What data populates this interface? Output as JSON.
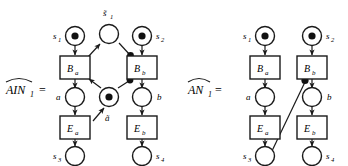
{
  "figure": {
    "background_color": "#ffffff",
    "stroke_color": "#1a1a1a",
    "token_color": "#111111",
    "nets": [
      {
        "id": "left-net",
        "label_main": "AIN",
        "label_sub": "1",
        "label_equals": "=",
        "label_full": "AIN̂₁ =",
        "places": [
          {
            "id": "s1",
            "label": "s",
            "sub": "1",
            "tokens": 1,
            "label_side": "left"
          },
          {
            "id": "s1t",
            "label": "s̃",
            "sub": "1",
            "tokens": 0,
            "label_side": "top"
          },
          {
            "id": "s2",
            "label": "s",
            "sub": "2",
            "tokens": 1,
            "label_side": "right"
          },
          {
            "id": "a",
            "label": "a",
            "sub": "",
            "tokens": 0,
            "label_side": "left"
          },
          {
            "id": "at",
            "label": "ã",
            "sub": "",
            "tokens": 1,
            "label_side": "bottom"
          },
          {
            "id": "b",
            "label": "b",
            "sub": "",
            "tokens": 0,
            "label_side": "right"
          },
          {
            "id": "s3",
            "label": "s",
            "sub": "3",
            "tokens": 0,
            "label_side": "left"
          },
          {
            "id": "s4",
            "label": "s",
            "sub": "4",
            "tokens": 0,
            "label_side": "right"
          }
        ],
        "transitions": [
          {
            "id": "Ba",
            "label": "B",
            "sub": "a"
          },
          {
            "id": "Bb",
            "label": "B",
            "sub": "b"
          },
          {
            "id": "Ea",
            "label": "E",
            "sub": "a"
          },
          {
            "id": "Eb",
            "label": "E",
            "sub": "b"
          }
        ],
        "arcs": [
          {
            "from": "s1",
            "to": "Ba",
            "kind": "arrow"
          },
          {
            "from": "s2",
            "to": "Bb",
            "kind": "arrow"
          },
          {
            "from": "Ba",
            "to": "a",
            "kind": "arrow"
          },
          {
            "from": "Bb",
            "to": "b",
            "kind": "arrow"
          },
          {
            "from": "a",
            "to": "Ea",
            "kind": "arrow"
          },
          {
            "from": "b",
            "to": "Eb",
            "kind": "arrow"
          },
          {
            "from": "Ea",
            "to": "s3",
            "kind": "arrow"
          },
          {
            "from": "Eb",
            "to": "s4",
            "kind": "arrow"
          },
          {
            "from": "Ba",
            "to": "s1t",
            "kind": "arrow"
          },
          {
            "from": "s1t",
            "to": "Bb",
            "kind": "dot"
          },
          {
            "from": "at",
            "to": "Ba",
            "kind": "arrow"
          },
          {
            "from": "at",
            "to": "Bb",
            "kind": "dot"
          },
          {
            "from": "Ea",
            "to": "at",
            "kind": "arrow"
          }
        ]
      },
      {
        "id": "right-net",
        "label_main": "AN",
        "label_sub": "1",
        "label_equals": "=",
        "label_full": "AN̂₁ =",
        "places": [
          {
            "id": "s1",
            "label": "s",
            "sub": "1",
            "tokens": 1,
            "label_side": "left"
          },
          {
            "id": "s2",
            "label": "s",
            "sub": "2",
            "tokens": 1,
            "label_side": "right"
          },
          {
            "id": "a",
            "label": "a",
            "sub": "",
            "tokens": 0,
            "label_side": "left"
          },
          {
            "id": "b",
            "label": "b",
            "sub": "",
            "tokens": 0,
            "label_side": "right"
          },
          {
            "id": "s3",
            "label": "s",
            "sub": "3",
            "tokens": 0,
            "label_side": "left"
          },
          {
            "id": "s4",
            "label": "s",
            "sub": "4",
            "tokens": 0,
            "label_side": "right"
          }
        ],
        "transitions": [
          {
            "id": "Ba",
            "label": "B",
            "sub": "a"
          },
          {
            "id": "Bb",
            "label": "B",
            "sub": "b"
          },
          {
            "id": "Ea",
            "label": "E",
            "sub": "a"
          },
          {
            "id": "Eb",
            "label": "E",
            "sub": "b"
          }
        ],
        "arcs": [
          {
            "from": "s1",
            "to": "Ba",
            "kind": "arrow"
          },
          {
            "from": "s2",
            "to": "Bb",
            "kind": "arrow"
          },
          {
            "from": "Ba",
            "to": "a",
            "kind": "arrow"
          },
          {
            "from": "Bb",
            "to": "b",
            "kind": "arrow"
          },
          {
            "from": "a",
            "to": "Ea",
            "kind": "arrow"
          },
          {
            "from": "b",
            "to": "Eb",
            "kind": "arrow"
          },
          {
            "from": "Ea",
            "to": "s3",
            "kind": "arrow"
          },
          {
            "from": "Eb",
            "to": "s4",
            "kind": "arrow"
          },
          {
            "from": "s3",
            "to": "Bb",
            "kind": "dot"
          }
        ]
      }
    ]
  },
  "labels": {
    "left_net_name": "AIN",
    "left_net_sub": "1",
    "right_net_name": "AN",
    "right_net_sub": "1",
    "equals": "=",
    "s1": "s",
    "s1_sub": "1",
    "s1_tilde": "s̃",
    "s1_tilde_sub": "1",
    "s2": "s",
    "s2_sub": "2",
    "s3": "s",
    "s3_sub": "3",
    "s4": "s",
    "s4_sub": "4",
    "a": "a",
    "a_tilde": "ã",
    "b": "b",
    "Ba": "B",
    "Ba_sub": "a",
    "Bb": "B",
    "Bb_sub": "b",
    "Ea": "E",
    "Ea_sub": "a",
    "Eb": "E",
    "Eb_sub": "b"
  }
}
